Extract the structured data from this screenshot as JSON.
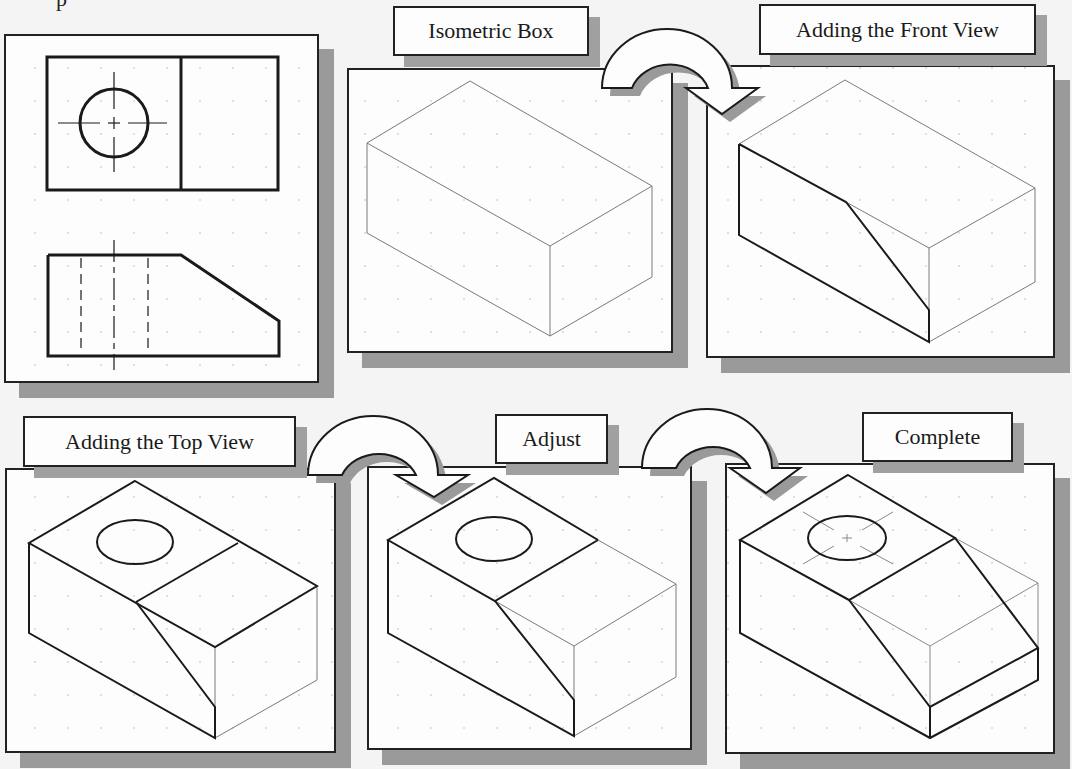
{
  "top_fragment": "p",
  "panels": [
    {
      "id": "orthographic",
      "label": null,
      "description": "Two-view orthographic drawing: top view with circle and centerlines, front view with chamfer and hidden lines"
    },
    {
      "id": "isometric-box",
      "label": "Isometric Box"
    },
    {
      "id": "front-view",
      "label": "Adding the Front View"
    },
    {
      "id": "top-view",
      "label": "Adding the Top View"
    },
    {
      "id": "adjust",
      "label": "Adjust"
    },
    {
      "id": "complete",
      "label": "Complete"
    }
  ],
  "arrows": [
    {
      "from": "isometric-box",
      "to": "front-view",
      "icon": "curved-arrow-icon"
    },
    {
      "from": "top-view",
      "to": "adjust",
      "icon": "curved-arrow-icon"
    },
    {
      "from": "adjust",
      "to": "complete",
      "icon": "curved-arrow-icon"
    }
  ],
  "colors": {
    "line": "#1a1a1a",
    "construction_line": "#8a8a8a",
    "panel_bg": "#fdfdfd",
    "shadow": "#9a9a9a",
    "page_bg": "#f4f4f4"
  }
}
